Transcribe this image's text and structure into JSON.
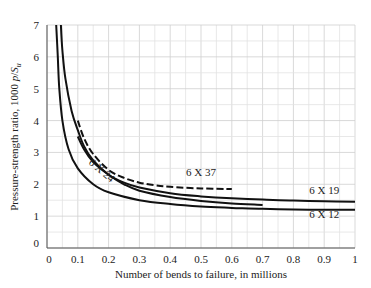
{
  "chart_data": {
    "type": "line",
    "title": "",
    "xlabel": "Number of bends to failure, in millions",
    "ylabel": "Pressure-strength ratio, 1000 p/S_u",
    "ylabel_parts": {
      "main": "Pressure-strength ratio, 1000 ",
      "p": "p",
      "slash": "/",
      "S": "S",
      "sub": "u"
    },
    "xlim": [
      0,
      1
    ],
    "ylim": [
      0,
      7
    ],
    "x_ticks": [
      "0",
      "0.1",
      "0.2",
      "0.3",
      "0.4",
      "0.5",
      "0.6",
      "0.7",
      "0.8",
      "0.9",
      "1"
    ],
    "y_ticks": [
      "0",
      "1",
      "2",
      "3",
      "4",
      "5",
      "6",
      "7"
    ],
    "grid": true,
    "legend": "inline labels",
    "series": [
      {
        "name": "6 X 12",
        "style": "solid",
        "x": [
          0.03,
          0.035,
          0.04,
          0.05,
          0.07,
          0.1,
          0.15,
          0.2,
          0.3,
          0.4,
          0.5,
          0.6,
          0.7,
          0.8,
          0.9,
          1.0
        ],
        "y": [
          7.0,
          6.0,
          5.0,
          4.0,
          3.1,
          2.5,
          2.0,
          1.75,
          1.5,
          1.38,
          1.3,
          1.26,
          1.23,
          1.21,
          1.2,
          1.2
        ]
      },
      {
        "name": "6 X 24",
        "style": "solid",
        "x": [
          0.1,
          0.12,
          0.15,
          0.2,
          0.25,
          0.3,
          0.4,
          0.5,
          0.6,
          0.7
        ],
        "y": [
          3.5,
          3.1,
          2.7,
          2.3,
          2.0,
          1.8,
          1.6,
          1.48,
          1.4,
          1.35
        ]
      },
      {
        "name": "6 X 19",
        "style": "solid",
        "x": [
          0.045,
          0.05,
          0.06,
          0.08,
          0.1,
          0.12,
          0.15,
          0.2,
          0.25,
          0.3,
          0.4,
          0.5,
          0.6,
          0.7,
          0.8,
          0.9,
          1.0
        ],
        "y": [
          7.0,
          6.2,
          5.3,
          4.3,
          3.7,
          3.2,
          2.75,
          2.3,
          2.05,
          1.9,
          1.72,
          1.62,
          1.56,
          1.52,
          1.49,
          1.47,
          1.45
        ]
      },
      {
        "name": "6 X 37",
        "style": "dashed",
        "x": [
          0.1,
          0.12,
          0.15,
          0.2,
          0.25,
          0.3,
          0.35,
          0.4,
          0.5,
          0.6
        ],
        "y": [
          4.0,
          3.45,
          2.95,
          2.45,
          2.2,
          2.05,
          1.97,
          1.92,
          1.87,
          1.85
        ]
      }
    ],
    "annotations": [
      {
        "text": "6 X 37",
        "x": 0.5,
        "y": 2.25
      },
      {
        "text": "6 X 24",
        "x": 0.17,
        "y": 2.35,
        "rotation": 40
      },
      {
        "text": "6 X 19",
        "x": 0.9,
        "y": 1.7
      },
      {
        "text": "6 X 12",
        "x": 0.9,
        "y": 0.95
      }
    ]
  }
}
